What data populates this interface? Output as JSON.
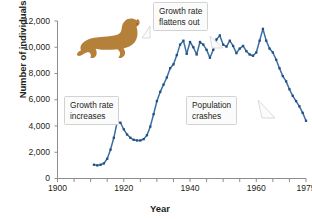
{
  "chart_data": {
    "type": "line",
    "title": "",
    "xlabel": "Year",
    "ylabel": "Number of individuals",
    "xlim": [
      1900,
      1975
    ],
    "ylim": [
      0,
      12000
    ],
    "ytick_labels": [
      "12,000",
      "10,000",
      "8,000",
      "6,000",
      "4,000",
      "2,000",
      "0"
    ],
    "ytick_values": [
      12000,
      10000,
      8000,
      6000,
      4000,
      2000,
      0
    ],
    "xtick_labels": [
      "1900",
      "1920",
      "1940",
      "1960",
      "1975"
    ],
    "xtick_values": [
      1900,
      1920,
      1940,
      1960,
      1975
    ],
    "minor_tick_interval": 5,
    "grid": false,
    "legend": "none",
    "line_color": "#3a6ea5",
    "marker": "square",
    "series": [
      {
        "name": "Northern fur seal population",
        "x": [
          1911,
          1912,
          1913,
          1914,
          1915,
          1916,
          1917,
          1918,
          1919,
          1920,
          1921,
          1922,
          1923,
          1924,
          1925,
          1926,
          1927,
          1928,
          1929,
          1930,
          1931,
          1932,
          1933,
          1934,
          1935,
          1936,
          1937,
          1938,
          1939,
          1940,
          1941,
          1942,
          1943,
          1944,
          1945,
          1946,
          1947,
          1948,
          1949,
          1950,
          1951,
          1952,
          1953,
          1954,
          1955,
          1956,
          1957,
          1958,
          1959,
          1960,
          1961,
          1962,
          1963,
          1964,
          1965,
          1966,
          1967,
          1968,
          1969,
          1970,
          1971,
          1972,
          1973,
          1974,
          1975
        ],
        "values": [
          1050,
          1000,
          1050,
          1150,
          1500,
          2200,
          3100,
          4300,
          4250,
          3750,
          3350,
          3100,
          2950,
          2900,
          2900,
          3000,
          3300,
          3950,
          4900,
          5900,
          6600,
          7150,
          7700,
          8400,
          8700,
          9400,
          10200,
          10500,
          9500,
          10400,
          10000,
          9450,
          10400,
          10200,
          9800,
          9200,
          9800,
          10600,
          10900,
          10200,
          10050,
          10500,
          10100,
          9550,
          9900,
          10100,
          9700,
          9450,
          9350,
          9600,
          10500,
          11400,
          10500,
          9900,
          9600,
          9050,
          8400,
          7800,
          7400,
          6800,
          6300,
          5900,
          5500,
          5000,
          4400
        ]
      }
    ],
    "annotations": [
      {
        "id": "growth-increases",
        "text_line1": "Growth rate",
        "text_line2": "increases"
      },
      {
        "id": "growth-flattens",
        "text_line1": "Growth rate",
        "text_line2": "flattens out"
      },
      {
        "id": "population-crashes",
        "text_line1": "Population",
        "text_line2": "crashes"
      }
    ],
    "illustration": {
      "name": "sea-lion-silhouette",
      "color": "#b5803a"
    }
  }
}
